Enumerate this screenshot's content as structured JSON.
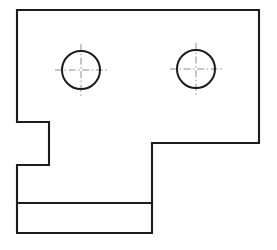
{
  "drawing": {
    "title": "Orthographic plate view",
    "view_type": "front-view",
    "background_color": "#ffffff",
    "line_color": "#1c1c1c",
    "centerline_color": "#8c8c8c",
    "outline_stroke_width": 2.1,
    "centerline_stroke_width": 1.0,
    "centerline_dash_pattern": "7 2.6 1.4 2.6",
    "canvas": {
      "width": 277,
      "height": 250
    },
    "outline": {
      "name": "plate-outline",
      "closed": true,
      "points": [
        [
          17,
          10
        ],
        [
          259,
          10
        ],
        [
          259,
          143
        ],
        [
          152,
          143
        ],
        [
          152,
          233
        ],
        [
          17,
          233
        ],
        [
          17,
          165
        ],
        [
          49,
          165
        ],
        [
          49,
          122
        ],
        [
          17,
          122
        ]
      ],
      "path": "M 17 10 L 259 10 L 259 143 L 152 143 L 152 233 L 17 233 L 17 165 L 49 165 L 49 122 L 17 122 Z"
    },
    "interior_lines": [
      {
        "name": "flange-divider-line",
        "orientation": "horizontal",
        "x1": 17,
        "y1": 203,
        "x2": 152,
        "y2": 203
      }
    ],
    "holes": [
      {
        "name": "left-hole",
        "cx": 81,
        "cy": 70,
        "r": 19,
        "centerline_overhang": 7
      },
      {
        "name": "right-hole",
        "cx": 196,
        "cy": 69,
        "r": 19,
        "centerline_overhang": 7
      }
    ]
  }
}
